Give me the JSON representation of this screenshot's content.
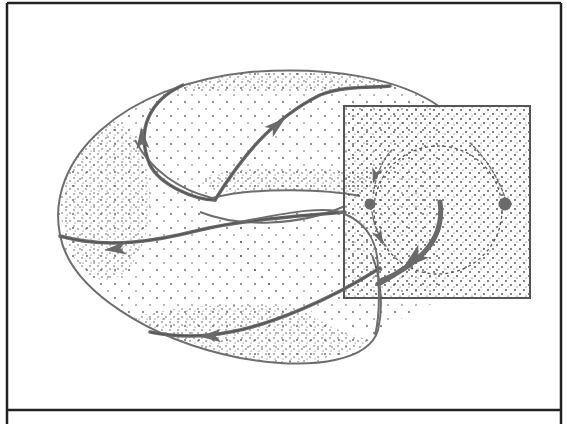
{
  "figure": {
    "width": 567,
    "height": 424,
    "background": "#ffffff",
    "frame": {
      "x": 7,
      "y": 3,
      "right": 561,
      "divider_y": 410,
      "stroke": "#222222",
      "stroke_width": 2.5
    },
    "caption": ""
  },
  "colors": {
    "outline": "#6e6e6e",
    "flow": "#6a6a6a",
    "flow_dark": "#2a2a2a",
    "stipple": "#5a5a5a",
    "section_border": "#555555",
    "dashed": "#555555"
  },
  "torus": {
    "label": "torus surface",
    "outer_outline": "M 60 235 C 45 160, 120 85, 250 72 C 330 66, 400 78, 440 107",
    "inner_hole_top": "M 212 198 C 260 186, 330 190, 360 196",
    "inner_hole_bottom": "M 200 212 C 240 228, 300 226, 345 206",
    "saddle_left": "M 135 140 C 150 170, 180 190, 212 198",
    "lower_front": "M 60 235 C 70 290, 150 340, 240 358 C 320 372, 370 358, 378 330 C 385 300, 378 270, 372 255",
    "tube_cap": "M 240 222 C 290 212, 330 205, 345 214 C 370 225, 378 245, 378 270 C 380 300, 379 320, 375 335"
  },
  "flows": [
    {
      "name": "flow-upper-left",
      "d": "M 183 85 C 150 100, 135 130, 150 165 C 160 185, 195 200, 215 200",
      "arrow": {
        "x": 142,
        "y": 138,
        "angle": -95
      }
    },
    {
      "name": "flow-upper-middle",
      "d": "M 215 200 C 240 160, 270 120, 320 95 C 345 85, 375 88, 390 86",
      "arrow": {
        "x": 277,
        "y": 125,
        "angle": -40
      }
    },
    {
      "name": "flow-left-band",
      "d": "M 345 212 C 300 216, 240 220, 200 230 C 160 240, 110 250, 60 236",
      "arrow": {
        "x": 115,
        "y": 249,
        "angle": 175
      }
    },
    {
      "name": "flow-bottom-band",
      "d": "M 380 268 C 330 300, 270 325, 230 332 C 200 338, 170 336, 150 332",
      "arrow": {
        "x": 210,
        "y": 336,
        "angle": 178
      }
    }
  ],
  "poincare_section": {
    "label": "Poincaré section",
    "rect": {
      "x": 344,
      "y": 106,
      "w": 186,
      "h": 192
    },
    "dashed_circle": {
      "cx": 438,
      "cy": 210,
      "r": 64
    },
    "fixed_points": [
      {
        "name": "fixed-point-left",
        "cx": 370,
        "cy": 204,
        "r": 5.5
      },
      {
        "name": "fixed-point-right",
        "cx": 505,
        "cy": 204,
        "r": 6.5
      }
    ],
    "arcs": [
      {
        "name": "arc-upper-left",
        "d": "M 392 150 C 382 160, 376 175, 373 195",
        "arrow": {
          "x": 375,
          "y": 176,
          "angle": 105
        }
      },
      {
        "name": "arc-right",
        "d": "M 470 143 C 488 160, 500 182, 505 198",
        "arrow": null
      },
      {
        "name": "arc-lower-left",
        "d": "M 372 212 C 374 225, 378 235, 386 246",
        "arrow": {
          "x": 380,
          "y": 238,
          "angle": 65
        }
      },
      {
        "name": "arc-big-inner",
        "d": "M 440 202 C 444 230, 430 252, 405 268 C 395 274, 386 280, 378 284",
        "arrow": {
          "x": 413,
          "y": 260,
          "angle": 140
        }
      }
    ]
  }
}
